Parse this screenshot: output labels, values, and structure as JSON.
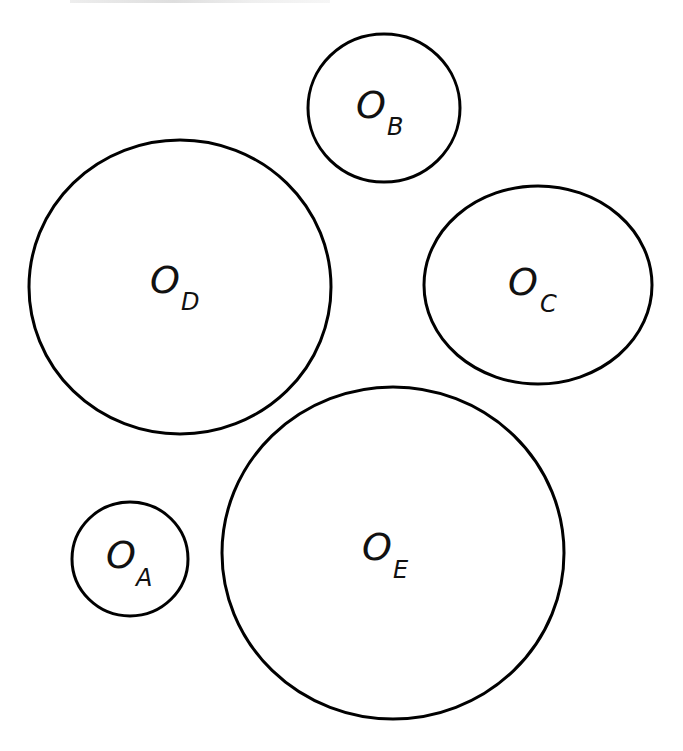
{
  "diagram": {
    "stroke_color": "#000000",
    "background": "#ffffff",
    "circles": [
      {
        "id": "B",
        "main": "O",
        "sub": "B",
        "cx": 384,
        "cy": 108,
        "rx": 76,
        "ry": 74
      },
      {
        "id": "D",
        "main": "O",
        "sub": "D",
        "cx": 180,
        "cy": 287,
        "rx": 151,
        "ry": 147
      },
      {
        "id": "C",
        "main": "O",
        "sub": "C",
        "cx": 538,
        "cy": 285,
        "rx": 114,
        "ry": 99
      },
      {
        "id": "E",
        "main": "O",
        "sub": "E",
        "cx": 393,
        "cy": 553,
        "rx": 171,
        "ry": 166
      },
      {
        "id": "A",
        "main": "O",
        "sub": "A",
        "cx": 130,
        "cy": 559,
        "rx": 58,
        "ry": 57
      }
    ]
  }
}
